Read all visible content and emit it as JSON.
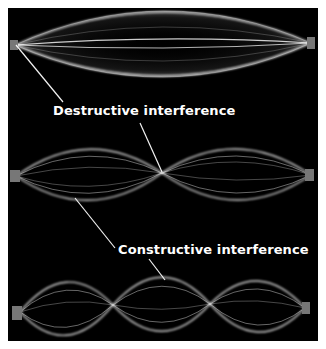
{
  "figure": {
    "background_color": "#000000",
    "wave_color": "#ffffff",
    "waves": [
      {
        "name": "fundamental",
        "loops": 1,
        "nodes_x": [
          15,
          311
        ],
        "center_y": 44,
        "amplitude": 33
      },
      {
        "name": "second-harmonic",
        "loops": 2,
        "nodes_x": [
          16,
          162,
          311
        ],
        "center_y": 176,
        "amplitude": 26
      },
      {
        "name": "third-harmonic",
        "loops": 3,
        "nodes_x": [
          20,
          113,
          210,
          305
        ],
        "center_y": 313,
        "amplitude": 28
      }
    ]
  },
  "labels": {
    "destructive": "Destructive interference",
    "constructive": "Constructive interference"
  }
}
